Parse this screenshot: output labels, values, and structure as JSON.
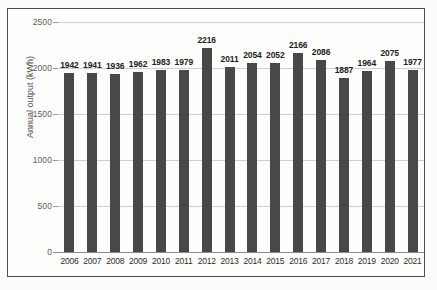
{
  "figure": {
    "background_color": "#fdfdfc",
    "frame_color": "#4a4a4a",
    "bar_color": "#484848",
    "gridline_color": "#cfcfcf"
  },
  "chart_data": {
    "type": "bar",
    "title": "",
    "subtitle": "",
    "xlabel": "",
    "ylabel": "Annual output (kWh)",
    "categories": [
      "2006",
      "2007",
      "2008",
      "2009",
      "2010",
      "2011",
      "2012",
      "2013",
      "2014",
      "2015",
      "2016",
      "2017",
      "2018",
      "2019",
      "2020",
      "2021"
    ],
    "values": [
      1942,
      1941,
      1936,
      1962,
      1983,
      1979,
      2216,
      2011,
      2054,
      2052,
      2166,
      2086,
      1887,
      1964,
      2075,
      1977
    ],
    "data_labels": [
      "1942",
      "1941",
      "1936",
      "1962",
      "1983",
      "1979",
      "2216",
      "2011",
      "2054",
      "2052",
      "2166",
      "2086",
      "1887",
      "1964",
      "2075",
      "1977"
    ],
    "ylim": [
      0,
      2500
    ],
    "yticks": [
      0,
      500,
      1000,
      1500,
      2000,
      2500
    ],
    "ytick_labels": [
      "0",
      "500",
      "1000",
      "1500",
      "2000",
      "2500"
    ],
    "grid": true,
    "legend": false,
    "legend_position": "none",
    "series": [
      {
        "name": "Annual output (kWh)",
        "values": [
          1942,
          1941,
          1936,
          1962,
          1983,
          1979,
          2216,
          2011,
          2054,
          2052,
          2166,
          2086,
          1887,
          1964,
          2075,
          1977
        ]
      }
    ]
  },
  "scan_artifacts": {
    "ghost_text": [
      "Smart technologies and their monthly usage",
      "since renewable sources of equipment including",
      "the annual output of the system was recorded",
      "and the figures are presented in the chart"
    ]
  }
}
